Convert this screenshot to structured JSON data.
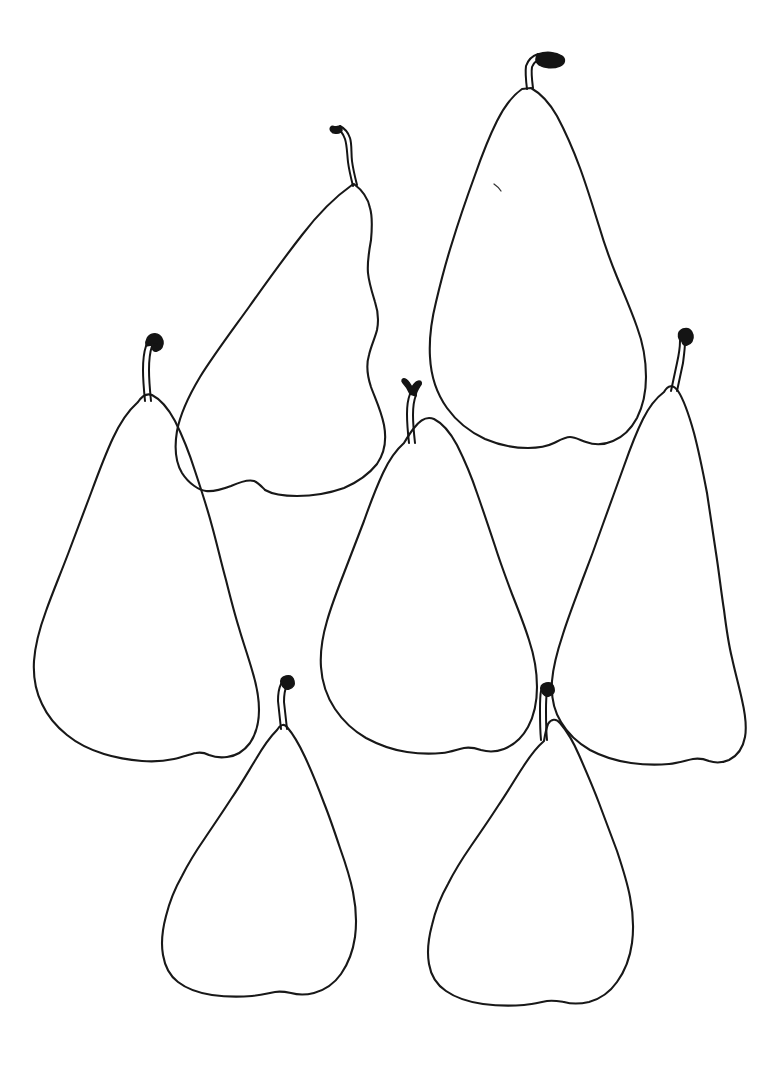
{
  "artwork": {
    "title": "Seven Pears",
    "medium": "ink contour line drawing",
    "subject": "pears",
    "subject_count": 7,
    "background_color": "#ffffff",
    "ink_color": "#181818",
    "canvas": {
      "width": 777,
      "height": 1066
    }
  },
  "pears": [
    {
      "id": "pear-upper-left",
      "label": "Upper left tilted pear",
      "stem_label": "Stem of upper left pear",
      "stem_direction": "curves up and to the left with a small looped tip",
      "bounds": {
        "x": 170,
        "y": 130,
        "width": 220,
        "height": 375
      },
      "body_path": "M352 185 C335 197 318 214 302 235 C284 258 266 283 249 307 C231 332 213 356 200 377 C188 397 180 415 177 431 C174 449 176 463 182 473 C189 484 199 490 206 491 C214 492 223 489 231 486 C240 482 248 479 254 481 C259 483 262 487 265 490 C272 494 283 496 297 496 C313 496 330 493 344 488 C358 482 369 474 377 464 C384 454 387 441 384 425 C381 410 375 398 371 387 C367 375 366 365 369 355 C371 346 375 338 377 330 C379 320 378 311 375 302 C372 292 369 283 368 273 C367 262 369 251 371 240 C372 229 373 218 370 208 C368 198 362 190 354 184 Z",
      "stem_path": "M353 186 C351 178 349 170 348 162 C347 153 347 145 345 139 C343 133 339 129 335 127",
      "stem_path_b": "M357 185 C355 177 353 169 352 161 C351 152 352 144 350 138 C348 132 344 128 340 126",
      "stem_tip_path": "M335 127 C331 125 329 128 331 131 C333 134 338 134 341 132 C343 130 342 127 340 126 Z"
    },
    {
      "id": "pear-upper-right",
      "label": "Upper right large pear",
      "stem_label": "Stem of upper right pear",
      "stem_direction": "rises then bends sharply right into a thick dark tip",
      "bounds": {
        "x": 420,
        "y": 55,
        "width": 230,
        "height": 395
      },
      "body_path": "M522 89 C512 96 504 107 497 121 C489 137 482 155 475 175 C467 197 459 220 452 243 C445 265 440 285 436 302 C431 322 429 340 430 357 C431 377 437 394 447 408 C457 422 470 432 485 439 C499 445 514 448 528 448 C539 448 548 446 554 443 C560 440 565 437 570 437 C575 437 580 440 586 442 C594 445 604 445 613 441 C623 437 631 429 637 418 C643 406 646 392 646 377 C646 360 643 343 637 327 C631 310 624 294 617 277 C610 260 604 243 599 226 C593 207 587 187 580 168 C573 149 565 131 557 116 C549 102 540 93 531 88 Z",
      "stem_path": "M527 89 C526 81 525 73 526 66 C528 60 532 56 538 54",
      "stem_path_b": "M533 88 C532 80 531 73 532 67 C534 62 538 59 543 58",
      "stem_tip_path": "M538 54 C546 51 556 52 562 56 C566 59 565 64 560 66 C553 69 544 68 539 65 C535 62 535 57 538 54 Z",
      "blemish_path": "M494 184 C497 186 499 188 501 191"
    },
    {
      "id": "pear-left",
      "label": "Left tall pear",
      "stem_label": "Stem of left pear",
      "stem_direction": "nearly vertical with a small hook curling right at the tip",
      "bounds": {
        "x": 30,
        "y": 330,
        "width": 230,
        "height": 440
      },
      "body_path": "M137 403 C128 411 120 423 113 438 C105 455 98 474 91 493 C83 514 75 535 68 554 C60 575 52 594 46 611 C39 630 35 647 34 661 C33 678 36 692 42 704 C48 717 57 727 67 735 C78 744 91 750 104 754 C117 758 130 760 142 761 C154 762 165 761 174 759 C183 757 190 754 196 753 C201 752 205 753 209 755 C214 757 220 758 227 757 C236 756 244 751 250 743 C256 734 259 723 259 710 C259 697 256 683 252 670 C248 656 243 642 239 628 C234 612 230 596 226 580 C221 562 217 544 212 526 C207 507 201 489 195 471 C189 452 182 435 175 421 C168 408 160 399 152 395 C147 393 142 396 138 402 Z",
      "stem_path": "M145 401 C144 391 143 380 143 370 C143 360 144 352 146 346",
      "stem_path_b": "M151 401 C150 391 149 380 149 370 C149 360 150 352 152 346",
      "stem_tip_path": "M146 346 C145 340 148 335 153 334 C158 333 162 336 163 341 C164 346 161 350 157 351 C154 352 152 350 152 347 C152 344 155 343 157 344 Z"
    },
    {
      "id": "pear-center",
      "label": "Center pear",
      "stem_label": "Stem of center pear",
      "stem_direction": "short, vertical, with a forked notched tip",
      "bounds": {
        "x": 315,
        "y": 400,
        "width": 235,
        "height": 355
      },
      "body_path": "M404 443 C396 450 389 460 383 473 C376 488 370 504 364 521 C357 539 350 557 344 573 C337 591 331 607 327 621 C322 638 320 653 321 667 C322 683 327 697 335 709 C343 721 354 731 366 738 C379 745 393 750 407 752 C420 754 432 754 442 753 C451 752 458 749 464 748 C470 747 475 748 481 750 C488 752 496 752 504 749 C514 745 522 738 528 727 C534 716 537 702 537 687 C537 671 534 655 529 640 C524 624 518 609 512 594 C506 578 500 562 495 546 C489 528 483 510 477 493 C471 475 464 459 457 445 C450 432 442 423 434 419 C427 416 420 420 414 428 C410 433 407 438 404 443 Z",
      "stem_path": "M409 443 C408 434 407 424 407 414 C407 406 408 399 410 394",
      "stem_path_b": "M415 443 C414 434 413 424 413 415 C413 407 414 400 416 395",
      "stem_tip_path": "M410 394 C408 389 405 385 403 383 C401 381 402 378 405 379 C408 380 410 384 412 387 C414 384 416 381 419 381 C422 381 422 384 420 386 C418 389 416 392 416 396 Z"
    },
    {
      "id": "pear-right",
      "label": "Right narrow pear",
      "stem_label": "Stem of right pear",
      "stem_direction": "slender S-curve with a tiny hook at the top",
      "bounds": {
        "x": 530,
        "y": 325,
        "width": 215,
        "height": 440
      },
      "body_path": "M664 392 C656 398 649 407 643 419 C636 433 630 449 624 466 C617 485 610 505 603 524 C596 544 589 563 582 581 C575 600 568 618 563 634 C557 652 553 668 552 681 C551 697 554 711 561 722 C568 734 578 743 590 750 C603 757 617 761 631 763 C645 765 658 765 669 764 C679 763 687 760 693 759 C699 758 704 759 709 761 C715 763 722 763 729 760 C737 756 743 748 745 737 C747 726 745 713 742 700 C739 686 735 672 732 658 C728 642 726 626 724 610 C721 591 719 572 716 553 C713 533 710 513 707 493 C703 472 699 452 694 433 C689 415 684 400 678 391 C673 384 668 385 664 392 Z",
      "stem_path": "M671 391 C673 382 675 372 677 363 C679 354 680 347 680 341",
      "stem_path_b": "M677 391 C679 382 681 372 683 363 C684 355 685 348 685 342",
      "stem_tip_path": "M680 341 C677 336 678 331 683 329 C688 327 692 330 693 335 C694 340 691 344 687 345 C684 346 682 344 682 341 Z"
    },
    {
      "id": "pear-bottom-left",
      "label": "Bottom left squat pear",
      "stem_label": "Stem of bottom left pear",
      "stem_direction": "short and straight with a flattened tip",
      "bounds": {
        "x": 145,
        "y": 670,
        "width": 230,
        "height": 320
      },
      "body_path": "M277 730 C270 737 263 747 256 759 C248 772 240 786 231 799 C222 813 213 826 205 838 C196 851 188 864 182 876 C174 890 169 904 166 916 C162 931 161 944 163 955 C165 967 170 976 178 982 C187 989 199 993 212 995 C226 997 240 997 252 996 C262 995 269 993 275 992 C281 991 286 992 291 993 C298 995 306 995 314 993 C325 990 334 984 341 974 C348 964 353 951 355 937 C357 922 356 907 353 892 C350 877 345 862 340 848 C335 833 330 818 324 803 C318 787 312 772 305 757 C299 744 293 734 287 727 C284 723 280 725 277 730 Z",
      "stem_path": "M281 729 C280 720 279 710 278 701 C278 694 279 688 281 684",
      "stem_path_b": "M287 729 C286 720 285 711 284 702 C284 695 285 689 287 685",
      "stem_tip_path": "M281 684 C280 680 282 677 286 676 C290 675 293 677 294 681 C295 685 293 688 289 689 C286 690 283 688 282 685 Z"
    },
    {
      "id": "pear-bottom-right",
      "label": "Bottom right squat pear",
      "stem_label": "Stem of bottom right pear",
      "stem_direction": "short, leaning slightly left, flattened tip",
      "bounds": {
        "x": 415,
        "y": 665,
        "width": 240,
        "height": 325
      },
      "body_path": "M544 741 C537 747 530 756 523 767 C515 779 507 793 498 806 C489 820 480 833 471 846 C462 859 454 872 448 884 C440 898 435 912 432 925 C428 940 427 953 429 964 C431 976 437 985 446 991 C456 998 469 1002 483 1004 C498 1006 512 1006 524 1005 C534 1004 541 1002 547 1001 C553 1000 558 1001 564 1002 C571 1004 580 1004 589 1002 C600 999 610 992 617 982 C625 971 630 958 632 943 C634 928 633 912 630 897 C627 881 622 866 617 851 C611 835 605 819 599 803 C593 787 586 771 579 755 C573 741 566 730 560 723 C556 718 551 719 548 724 C546 729 545 735 544 741 Z",
      "stem_path": "M541 740 C540 730 540 720 540 710 C540 702 540 696 541 691",
      "stem_path_b": "M547 740 C546 730 546 721 546 711 C546 703 546 697 547 692",
      "stem_tip_path": "M541 691 C540 687 542 684 546 683 C550 682 553 684 554 688 C555 692 553 695 549 696 C546 697 543 695 542 692 Z"
    }
  ]
}
